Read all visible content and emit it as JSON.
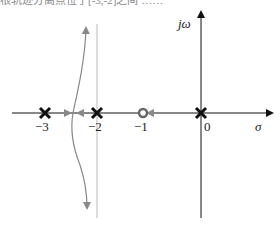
{
  "header_fragment": "根轨迹分离点位于[-3,-2]之间 ……",
  "diagram": {
    "type": "root-locus",
    "axes": {
      "real_label": "σ",
      "imag_label": "jω"
    },
    "ticks": [
      {
        "value": -3,
        "label": "−3"
      },
      {
        "value": -2,
        "label": "−2"
      },
      {
        "value": -1,
        "label": "−1"
      },
      {
        "value": 0,
        "label": "0"
      }
    ],
    "poles": [
      -3,
      -2,
      0
    ],
    "zeros": [
      -1
    ],
    "asymptote": -2,
    "colors": {
      "axis": "#111111",
      "locus": "#888888",
      "marker": "#111111",
      "zero": "#666666",
      "guide": "#bbbbbb"
    }
  }
}
